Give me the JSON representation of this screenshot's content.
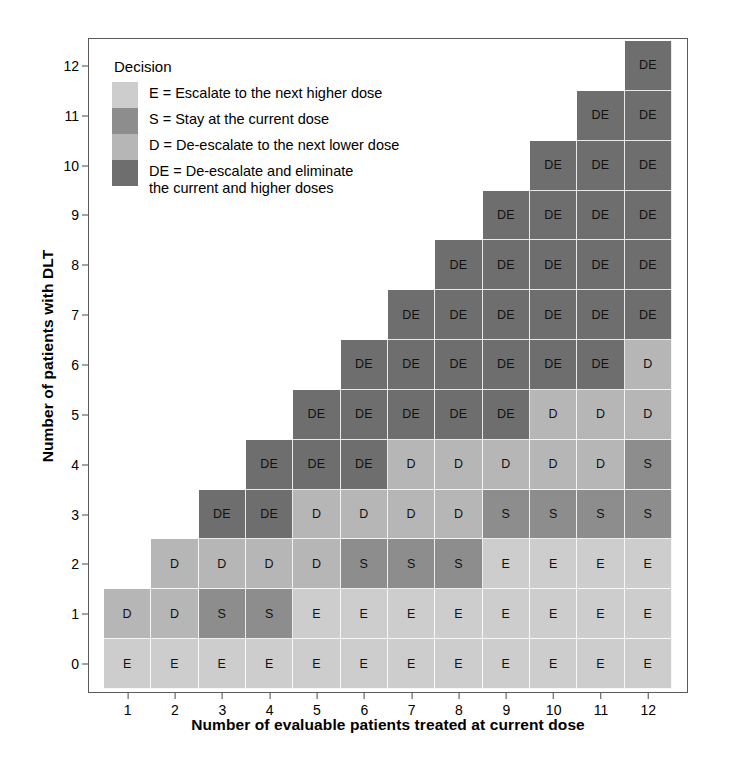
{
  "chart_data": {
    "type": "heatmap",
    "title": "",
    "xlabel": "Number of evaluable patients treated at current dose",
    "ylabel": "Number of patients with DLT",
    "x": [
      1,
      2,
      3,
      4,
      5,
      6,
      7,
      8,
      9,
      10,
      11,
      12
    ],
    "y": [
      0,
      1,
      2,
      3,
      4,
      5,
      6,
      7,
      8,
      9,
      10,
      11,
      12
    ],
    "xlim": [
      0.5,
      12.5
    ],
    "ylim": [
      -0.5,
      12.5
    ],
    "grid": false,
    "legend_position": "inside-top-left",
    "categories_legend": [
      "E",
      "S",
      "D",
      "DE"
    ],
    "cell_values": {
      "row_0": [
        "E",
        "E",
        "E",
        "E",
        "E",
        "E",
        "E",
        "E",
        "E",
        "E",
        "E",
        "E"
      ],
      "row_1": [
        "D",
        "D",
        "S",
        "S",
        "E",
        "E",
        "E",
        "E",
        "E",
        "E",
        "E",
        "E"
      ],
      "row_2": [
        "",
        "D",
        "D",
        "D",
        "D",
        "S",
        "S",
        "S",
        "E",
        "E",
        "E",
        "E"
      ],
      "row_3": [
        "",
        "",
        "DE",
        "DE",
        "D",
        "D",
        "D",
        "D",
        "S",
        "S",
        "S",
        "S"
      ],
      "row_4": [
        "",
        "",
        "",
        "DE",
        "DE",
        "DE",
        "D",
        "D",
        "D",
        "D",
        "D",
        "S"
      ],
      "row_5": [
        "",
        "",
        "",
        "",
        "DE",
        "DE",
        "DE",
        "DE",
        "DE",
        "D",
        "D",
        "D"
      ],
      "row_6": [
        "",
        "",
        "",
        "",
        "",
        "DE",
        "DE",
        "DE",
        "DE",
        "DE",
        "DE",
        "D"
      ],
      "row_7": [
        "",
        "",
        "",
        "",
        "",
        "",
        "DE",
        "DE",
        "DE",
        "DE",
        "DE",
        "DE"
      ],
      "row_8": [
        "",
        "",
        "",
        "",
        "",
        "",
        "",
        "DE",
        "DE",
        "DE",
        "DE",
        "DE"
      ],
      "row_9": [
        "",
        "",
        "",
        "",
        "",
        "",
        "",
        "",
        "DE",
        "DE",
        "DE",
        "DE"
      ],
      "row_10": [
        "",
        "",
        "",
        "",
        "",
        "",
        "",
        "",
        "",
        "DE",
        "DE",
        "DE"
      ],
      "row_11": [
        "",
        "",
        "",
        "",
        "",
        "",
        "",
        "",
        "",
        "",
        "DE",
        "DE"
      ],
      "row_12": [
        "",
        "",
        "",
        "",
        "",
        "",
        "",
        "",
        "",
        "",
        "",
        "DE"
      ]
    },
    "colors": {
      "E": "#cdcdcd",
      "S": "#8d8d8d",
      "D": "#b6b6b6",
      "DE": "#6e6e6e",
      "frame": "#5a5a5a",
      "text": "#111111",
      "background": "#ffffff"
    }
  },
  "axes": {
    "x_title": "Number of evaluable patients treated at current dose",
    "y_title": "Number of patients with DLT",
    "x_ticks": [
      "1",
      "2",
      "3",
      "4",
      "5",
      "6",
      "7",
      "8",
      "9",
      "10",
      "11",
      "12"
    ],
    "y_ticks": [
      "0",
      "1",
      "2",
      "3",
      "4",
      "5",
      "6",
      "7",
      "8",
      "9",
      "10",
      "11",
      "12"
    ]
  },
  "legend": {
    "title": "Decision",
    "items": [
      {
        "key": "E",
        "label": "E = Escalate to the next higher dose",
        "color": "#cdcdcd"
      },
      {
        "key": "S",
        "label": "S = Stay at the current dose",
        "color": "#8d8d8d"
      },
      {
        "key": "D",
        "label": "D = De-escalate to the next lower dose",
        "color": "#b6b6b6"
      },
      {
        "key": "DE",
        "label": "DE = De-escalate and eliminate\n the current and higher doses",
        "color": "#6e6e6e"
      }
    ]
  }
}
